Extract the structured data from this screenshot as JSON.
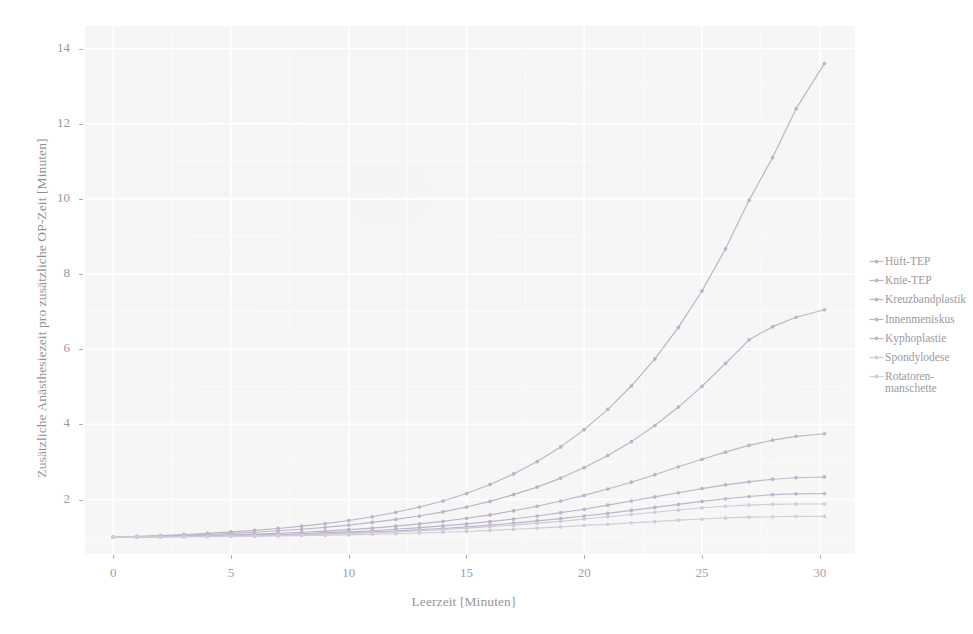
{
  "chart_data": {
    "type": "line",
    "title": "",
    "subtitle": "",
    "xlabel": "Leerzeit [Minuten]",
    "ylabel": "Zusätzliche Anästhesiezeit pro zusätzliche OP-Zeit [Minuten]",
    "xlim": [
      -1.2,
      31.5
    ],
    "ylim": [
      0.55,
      14.6
    ],
    "xticks": [
      0,
      5,
      10,
      15,
      20,
      25,
      30
    ],
    "yticks": [
      2,
      4,
      6,
      8,
      10,
      12,
      14
    ],
    "xtick_labels": [
      "0",
      "5",
      "10",
      "15",
      "20",
      "25",
      "30"
    ],
    "ytick_labels": [
      "2",
      "4",
      "6",
      "8",
      "10",
      "12",
      "14"
    ],
    "grid": true,
    "grid_color": "#ffffff",
    "panel_background": "#f2f2f2",
    "legend_position": "right",
    "x": [
      0,
      1,
      2,
      3,
      4,
      5,
      6,
      7,
      8,
      9,
      10,
      11,
      12,
      13,
      14,
      15,
      16,
      17,
      18,
      19,
      20,
      21,
      22,
      23,
      24,
      25,
      26,
      27,
      28,
      29,
      30.2
    ],
    "series": [
      {
        "name": "Hüft-TEP",
        "color": "#9d8fb0",
        "values": [
          1.0,
          1.02,
          1.04,
          1.07,
          1.1,
          1.14,
          1.18,
          1.23,
          1.29,
          1.36,
          1.44,
          1.54,
          1.66,
          1.8,
          1.96,
          2.16,
          2.4,
          2.68,
          3.01,
          3.4,
          3.86,
          4.4,
          5.02,
          5.74,
          6.58,
          7.55,
          8.67,
          9.96,
          11.1,
          12.4,
          13.6
        ]
      },
      {
        "name": "Knie-TEP",
        "color": "#9d8fb0",
        "values": [
          1.0,
          1.01,
          1.03,
          1.05,
          1.07,
          1.1,
          1.13,
          1.17,
          1.21,
          1.26,
          1.32,
          1.39,
          1.47,
          1.56,
          1.67,
          1.8,
          1.95,
          2.13,
          2.33,
          2.57,
          2.85,
          3.17,
          3.54,
          3.97,
          4.46,
          5.01,
          5.62,
          6.25,
          6.6,
          6.85,
          7.05
        ]
      },
      {
        "name": "Kreuzbandplastik",
        "color": "#9d8fb0",
        "values": [
          1.0,
          1.01,
          1.02,
          1.03,
          1.04,
          1.06,
          1.08,
          1.1,
          1.13,
          1.16,
          1.2,
          1.24,
          1.29,
          1.35,
          1.42,
          1.5,
          1.59,
          1.7,
          1.82,
          1.96,
          2.11,
          2.28,
          2.46,
          2.66,
          2.87,
          3.07,
          3.26,
          3.44,
          3.58,
          3.68,
          3.75
        ]
      },
      {
        "name": "Innenmeniskus",
        "color": "#9d8fb0",
        "values": [
          1.0,
          1.01,
          1.01,
          1.02,
          1.03,
          1.04,
          1.06,
          1.07,
          1.09,
          1.12,
          1.14,
          1.17,
          1.21,
          1.25,
          1.3,
          1.35,
          1.41,
          1.48,
          1.56,
          1.65,
          1.74,
          1.85,
          1.96,
          2.07,
          2.18,
          2.29,
          2.39,
          2.47,
          2.54,
          2.58,
          2.6
        ]
      },
      {
        "name": "Kyphoplastie",
        "color": "#9d8fb0",
        "values": [
          1.0,
          1.0,
          1.01,
          1.02,
          1.02,
          1.03,
          1.04,
          1.06,
          1.07,
          1.09,
          1.11,
          1.14,
          1.16,
          1.2,
          1.23,
          1.27,
          1.32,
          1.37,
          1.43,
          1.49,
          1.56,
          1.63,
          1.71,
          1.79,
          1.87,
          1.95,
          2.02,
          2.08,
          2.13,
          2.15,
          2.16
        ]
      },
      {
        "name": "Spondylodese",
        "color": "#b9aec6",
        "values": [
          1.0,
          1.0,
          1.01,
          1.01,
          1.02,
          1.03,
          1.04,
          1.05,
          1.06,
          1.08,
          1.1,
          1.12,
          1.14,
          1.17,
          1.2,
          1.24,
          1.28,
          1.32,
          1.37,
          1.42,
          1.48,
          1.54,
          1.6,
          1.66,
          1.72,
          1.78,
          1.82,
          1.85,
          1.87,
          1.88,
          1.88
        ]
      },
      {
        "name": "Rotatoren-\nmanschette",
        "color": "#bdb2c8",
        "values": [
          1.0,
          1.0,
          1.0,
          1.01,
          1.01,
          1.02,
          1.02,
          1.03,
          1.04,
          1.05,
          1.06,
          1.08,
          1.09,
          1.11,
          1.13,
          1.15,
          1.18,
          1.21,
          1.24,
          1.27,
          1.31,
          1.34,
          1.38,
          1.41,
          1.45,
          1.48,
          1.51,
          1.53,
          1.54,
          1.55,
          1.55
        ]
      }
    ]
  },
  "legend": {
    "items": [
      {
        "label": "Hüft-TEP"
      },
      {
        "label": "Knie-TEP"
      },
      {
        "label": "Kreuzbandplastik"
      },
      {
        "label": "Innenmeniskus"
      },
      {
        "label": "Kyphoplastie"
      },
      {
        "label": "Spondylodese"
      },
      {
        "label": "Rotatoren-\nmanschette"
      }
    ]
  }
}
